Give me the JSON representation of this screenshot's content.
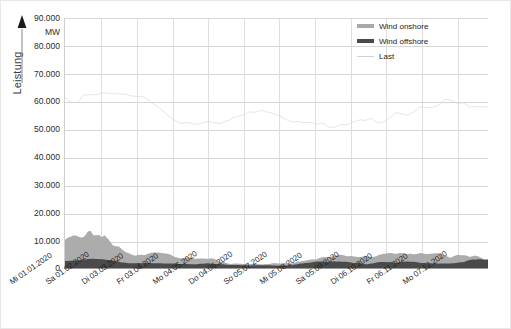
{
  "axes": {
    "y_title": "Leistung",
    "y_unit": "MW",
    "y_ticks": [
      "90.000",
      "80.000",
      "70.000",
      "60.000",
      "50.000",
      "40.000",
      "30.000",
      "20.000",
      "10.000",
      "0"
    ],
    "x_ticks": [
      "Mi 01.01.2020",
      "Sa 01.02.2020",
      "Di 03.03.2020",
      "Fr 03.04.2020",
      "Mo 04.05.2020",
      "Do 04.06.2020",
      "So 05.07.2020",
      "Mi 05.08.2020",
      "Sa 05.09.2020",
      "Di 06.10.2020",
      "Fr 06.11.2020",
      "Mo 07.12.2020"
    ]
  },
  "legend": {
    "items": [
      {
        "label": "Wind onshore",
        "color": "#a8a8a8"
      },
      {
        "label": "Wind offshore",
        "color": "#4a4a4a"
      },
      {
        "label": "Last",
        "color": "#d9d9d9"
      }
    ]
  },
  "colors": {
    "wind_onshore": "#a8a8a8",
    "wind_offshore": "#4a4a4a",
    "last": "#d9d9d9",
    "grid": "#d6d6d6",
    "axis": "#9a9a9a"
  },
  "chart_data": {
    "type": "area",
    "title": "",
    "subtitle": "",
    "xlabel": "",
    "ylabel": "Leistung",
    "yunit": "MW",
    "ylim": [
      0,
      90000
    ],
    "ytick_values": [
      0,
      10000,
      20000,
      30000,
      40000,
      50000,
      60000,
      70000,
      80000,
      90000
    ],
    "grid": true,
    "legend_position": "top-right",
    "x_range": [
      "2020-01-01",
      "2020-12-31"
    ],
    "x_tick_values": [
      "2020-01-01",
      "2020-02-01",
      "2020-03-03",
      "2020-04-03",
      "2020-05-04",
      "2020-06-04",
      "2020-07-05",
      "2020-08-05",
      "2020-09-05",
      "2020-10-06",
      "2020-11-06",
      "2020-12-07"
    ],
    "note": "Monthly aggregate statistics of German 2020 power time series sampled at high frequency; min/mean/max in MW per calendar month for each series.",
    "series": [
      {
        "name": "Last",
        "color": "#d9d9d9",
        "kind": "line",
        "months": [
          "Jan",
          "Feb",
          "Mar",
          "Apr",
          "May",
          "Jun",
          "Jul",
          "Aug",
          "Sep",
          "Oct",
          "Nov",
          "Dec"
        ],
        "min": [
          42000,
          41000,
          38000,
          33000,
          33000,
          35000,
          35000,
          34000,
          36000,
          38000,
          40000,
          38000
        ],
        "mean": [
          63000,
          62000,
          58000,
          51000,
          50000,
          53000,
          53000,
          52000,
          55000,
          58000,
          61000,
          58000
        ],
        "max": [
          76000,
          75000,
          72000,
          64000,
          62000,
          65000,
          65000,
          64000,
          67000,
          70000,
          73000,
          71000
        ]
      },
      {
        "name": "Wind onshore",
        "color": "#a8a8a8",
        "kind": "area",
        "months": [
          "Jan",
          "Feb",
          "Mar",
          "Apr",
          "May",
          "Jun",
          "Jul",
          "Aug",
          "Sep",
          "Oct",
          "Nov",
          "Dec"
        ],
        "min": [
          900,
          1200,
          800,
          600,
          500,
          500,
          500,
          500,
          500,
          600,
          600,
          800
        ],
        "mean": [
          16000,
          22000,
          15000,
          11000,
          9000,
          8000,
          8000,
          9000,
          8000,
          12000,
          12000,
          16000
        ],
        "max": [
          44000,
          46000,
          42000,
          38000,
          33000,
          31000,
          30000,
          34000,
          33000,
          40000,
          41000,
          45000
        ]
      },
      {
        "name": "Wind offshore",
        "color": "#4a4a4a",
        "kind": "area",
        "months": [
          "Jan",
          "Feb",
          "Mar",
          "Apr",
          "May",
          "Jun",
          "Jul",
          "Aug",
          "Sep",
          "Oct",
          "Nov",
          "Dec"
        ],
        "min": [
          100,
          150,
          100,
          50,
          50,
          50,
          50,
          50,
          50,
          50,
          50,
          100
        ],
        "mean": [
          3200,
          4000,
          2900,
          2200,
          1900,
          1800,
          1700,
          2000,
          1900,
          2600,
          2600,
          3200
        ],
        "max": [
          7000,
          7200,
          6900,
          6600,
          6400,
          6300,
          6200,
          6500,
          6500,
          6900,
          6900,
          7100
        ]
      }
    ]
  }
}
